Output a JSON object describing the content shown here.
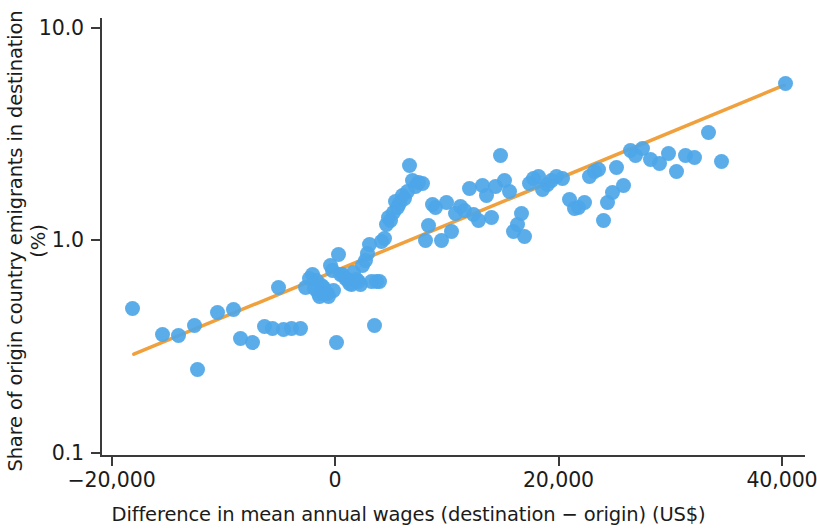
{
  "chart_data": {
    "type": "scatter",
    "title": "",
    "xlabel": "Difference in mean annual wages (destination − origin) (US$)",
    "ylabel": "Share of origin country emigrants in destination (%)",
    "xlim": [
      -22000,
      42000
    ],
    "ylim": [
      0.1,
      10.0
    ],
    "yscale": "log",
    "xscale": "linear",
    "grid": false,
    "legend": null,
    "xticks": [
      -20000,
      0,
      20000,
      40000
    ],
    "xticklabels": [
      "−20,000",
      "0",
      "20,000",
      "40,000"
    ],
    "yticks": [
      0.1,
      1.0,
      10.0
    ],
    "yticklabels": [
      "0.1",
      "1.0",
      "10.0"
    ],
    "marker_color": "#4da6e8",
    "trendline_color": "#f0a03c",
    "axis_color": "#3a3a3a",
    "series": [
      {
        "name": "Country pairs",
        "type": "scatter",
        "points": [
          [
            -18100,
            0.475
          ],
          [
            -15400,
            0.36
          ],
          [
            -14000,
            0.355
          ],
          [
            -12600,
            0.395
          ],
          [
            -12300,
            0.245
          ],
          [
            -10500,
            0.455
          ],
          [
            -9100,
            0.47
          ],
          [
            -8500,
            0.345
          ],
          [
            -7400,
            0.33
          ],
          [
            -6300,
            0.39
          ],
          [
            -5600,
            0.385
          ],
          [
            -5100,
            0.6
          ],
          [
            -4600,
            0.38
          ],
          [
            -3900,
            0.385
          ],
          [
            -3100,
            0.385
          ],
          [
            -2600,
            0.6
          ],
          [
            -2300,
            0.66
          ],
          [
            -2000,
            0.69
          ],
          [
            -1850,
            0.59
          ],
          [
            -1700,
            0.645
          ],
          [
            -1500,
            0.56
          ],
          [
            -1350,
            0.545
          ],
          [
            -1200,
            0.61
          ],
          [
            -1050,
            0.595
          ],
          [
            -900,
            0.56
          ],
          [
            -700,
            0.56
          ],
          [
            -550,
            0.545
          ],
          [
            -400,
            0.76
          ],
          [
            -250,
            0.72
          ],
          [
            -100,
            0.58
          ],
          [
            100,
            0.33
          ],
          [
            350,
            0.855
          ],
          [
            500,
            0.69
          ],
          [
            700,
            0.685
          ],
          [
            900,
            0.66
          ],
          [
            1100,
            0.65
          ],
          [
            1300,
            0.625
          ],
          [
            1500,
            0.615
          ],
          [
            1700,
            0.7
          ],
          [
            1900,
            0.65
          ],
          [
            2100,
            0.64
          ],
          [
            2300,
            0.615
          ],
          [
            2500,
            0.755
          ],
          [
            2700,
            0.8
          ],
          [
            2900,
            0.86
          ],
          [
            3100,
            0.95
          ],
          [
            3300,
            0.64
          ],
          [
            3500,
            0.395
          ],
          [
            3700,
            0.64
          ],
          [
            4000,
            0.635
          ],
          [
            4200,
            0.98
          ],
          [
            4400,
            1.02
          ],
          [
            4600,
            1.18
          ],
          [
            4800,
            1.28
          ],
          [
            4950,
            1.23
          ],
          [
            5200,
            1.35
          ],
          [
            5400,
            1.52
          ],
          [
            5600,
            1.42
          ],
          [
            5800,
            1.48
          ],
          [
            6000,
            1.62
          ],
          [
            6200,
            1.56
          ],
          [
            6500,
            1.7
          ],
          [
            6700,
            2.25
          ],
          [
            6900,
            1.9
          ],
          [
            7200,
            1.78
          ],
          [
            7500,
            1.86
          ],
          [
            7800,
            1.84
          ],
          [
            8100,
            1.0
          ],
          [
            8400,
            1.17
          ],
          [
            8700,
            1.47
          ],
          [
            9000,
            1.42
          ],
          [
            9500,
            1.0
          ],
          [
            10000,
            1.5
          ],
          [
            10400,
            1.1
          ],
          [
            10800,
            1.33
          ],
          [
            11200,
            1.44
          ],
          [
            11600,
            1.38
          ],
          [
            12000,
            1.75
          ],
          [
            12400,
            1.32
          ],
          [
            12800,
            1.23
          ],
          [
            13200,
            1.8
          ],
          [
            13600,
            1.62
          ],
          [
            14000,
            1.28
          ],
          [
            14400,
            1.78
          ],
          [
            14800,
            2.5
          ],
          [
            15200,
            1.9
          ],
          [
            15600,
            1.7
          ],
          [
            16000,
            1.1
          ],
          [
            16300,
            1.18
          ],
          [
            16700,
            1.33
          ],
          [
            17000,
            1.04
          ],
          [
            17400,
            1.85
          ],
          [
            17800,
            1.95
          ],
          [
            18200,
            2.0
          ],
          [
            18600,
            1.72
          ],
          [
            19000,
            1.83
          ],
          [
            19400,
            1.9
          ],
          [
            19800,
            2.0
          ],
          [
            20400,
            1.95
          ],
          [
            21000,
            1.55
          ],
          [
            21400,
            1.4
          ],
          [
            21800,
            1.42
          ],
          [
            22300,
            1.5
          ],
          [
            22800,
            2.0
          ],
          [
            23200,
            2.1
          ],
          [
            23600,
            2.15
          ],
          [
            24000,
            1.23
          ],
          [
            24400,
            1.5
          ],
          [
            24800,
            1.68
          ],
          [
            25200,
            2.2
          ],
          [
            25800,
            1.8
          ],
          [
            26400,
            2.65
          ],
          [
            26900,
            2.5
          ],
          [
            27500,
            2.7
          ],
          [
            28200,
            2.4
          ],
          [
            29000,
            2.3
          ],
          [
            29800,
            2.55
          ],
          [
            30600,
            2.1
          ],
          [
            31400,
            2.5
          ],
          [
            32200,
            2.45
          ],
          [
            33400,
            3.2
          ],
          [
            34600,
            2.35
          ],
          [
            40300,
            5.45
          ]
        ]
      },
      {
        "name": "Fitted trend line",
        "type": "line",
        "points": [
          [
            -18000,
            0.29
          ],
          [
            40200,
            5.35
          ]
        ]
      }
    ]
  }
}
